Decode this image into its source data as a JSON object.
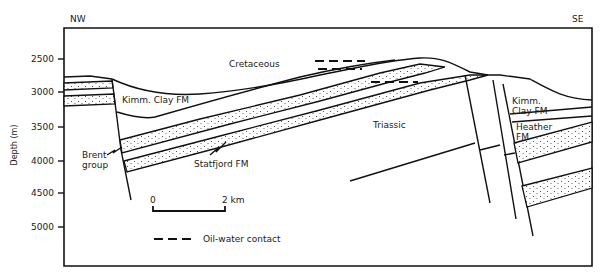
{
  "compass": {
    "left": "NW",
    "right": "SE"
  },
  "y_axis": {
    "title": "Depth (m)",
    "ticks": [
      {
        "label": "2500",
        "y": 59
      },
      {
        "label": "3000",
        "y": 92
      },
      {
        "label": "3500",
        "y": 127
      },
      {
        "label": "4000",
        "y": 161
      },
      {
        "label": "4500",
        "y": 193
      },
      {
        "label": "5000",
        "y": 227
      }
    ]
  },
  "labels": {
    "cretaceous": "Cretaceous",
    "kimm_clay_left": "Kimm. Clay FM",
    "kimm_clay_right_1": "Kimm.",
    "kimm_clay_right_2": "Clay FM",
    "heather_1": "Heather",
    "heather_2": "FM",
    "triassic": "Triassic",
    "brent_1": "Brent",
    "brent_2": "group",
    "statfjord": "Statfjord FM"
  },
  "scale_bar": {
    "start": "0",
    "end": "2 km"
  },
  "legend": {
    "oil_water_contact": "Oil-water contact"
  },
  "colors": {
    "ink": "#111111",
    "background": "#ffffff"
  }
}
